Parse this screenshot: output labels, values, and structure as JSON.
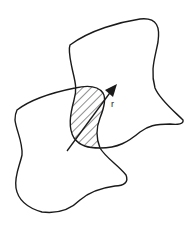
{
  "diagram": {
    "shapes": [
      "upper-right-region",
      "lower-left-region",
      "hatched-overlap-region"
    ],
    "vector_label": "r",
    "colors": {
      "stroke": "#1a1a1a",
      "hatch": "#444444",
      "background": "#ffffff"
    }
  }
}
